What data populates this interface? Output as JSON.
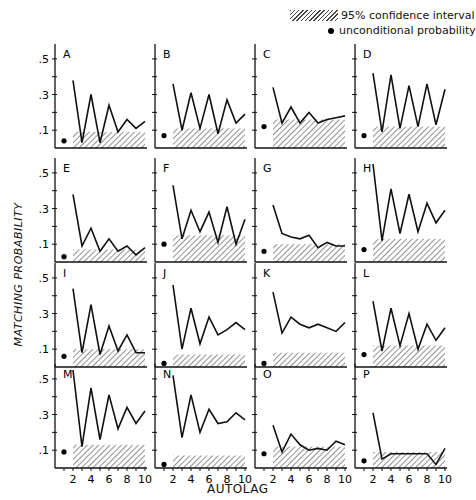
{
  "legend": {
    "ci_label": "95% confidence interval",
    "uncond_label": "unconditional probability"
  },
  "axes": {
    "ylabel": "MATCHING PROBABILITY",
    "xlabel": "AUTOLAG",
    "yticks": [
      ".1",
      ".3",
      ".5"
    ],
    "xticks": [
      "2",
      "4",
      "6",
      "8",
      "10"
    ]
  },
  "chart_data": {
    "type": "line",
    "title": "",
    "xlabel": "AUTOLAG",
    "ylabel": "MATCHING PROBABILITY",
    "xlim": [
      0,
      10
    ],
    "ylim": [
      0,
      0.55
    ],
    "grid": false,
    "legend_position": "top-right",
    "legend": [
      "95% confidence interval",
      "unconditional probability"
    ],
    "x": [
      2,
      3,
      4,
      5,
      6,
      7,
      8,
      9,
      10
    ],
    "panels": [
      {
        "label": "A",
        "uncond": 0.04,
        "values": [
          0.38,
          0.03,
          0.3,
          0.03,
          0.24,
          0.09,
          0.16,
          0.11,
          0.15
        ],
        "ci_upper": 0.09
      },
      {
        "label": "B",
        "uncond": 0.07,
        "values": [
          0.36,
          0.1,
          0.31,
          0.11,
          0.3,
          0.08,
          0.27,
          0.14,
          0.19
        ],
        "ci_upper": 0.11
      },
      {
        "label": "C",
        "uncond": 0.12,
        "values": [
          0.34,
          0.14,
          0.23,
          0.14,
          0.2,
          0.14,
          0.16,
          0.17,
          0.18
        ],
        "ci_upper": 0.16
      },
      {
        "label": "D",
        "uncond": 0.07,
        "values": [
          0.42,
          0.09,
          0.41,
          0.11,
          0.35,
          0.12,
          0.36,
          0.13,
          0.33
        ],
        "ci_upper": 0.12
      },
      {
        "label": "E",
        "uncond": 0.03,
        "values": [
          0.38,
          0.09,
          0.19,
          0.06,
          0.13,
          0.06,
          0.09,
          0.04,
          0.08
        ],
        "ci_upper": 0.07
      },
      {
        "label": "F",
        "uncond": 0.1,
        "values": [
          0.43,
          0.13,
          0.29,
          0.17,
          0.28,
          0.11,
          0.31,
          0.1,
          0.24
        ],
        "ci_upper": 0.15
      },
      {
        "label": "G",
        "uncond": 0.06,
        "values": [
          0.32,
          0.16,
          0.14,
          0.13,
          0.15,
          0.08,
          0.11,
          0.09,
          0.09
        ],
        "ci_upper": 0.1
      },
      {
        "label": "H",
        "uncond": 0.07,
        "values": [
          0.55,
          0.12,
          0.41,
          0.16,
          0.38,
          0.17,
          0.33,
          0.22,
          0.29
        ],
        "ci_upper": 0.13
      },
      {
        "label": "I",
        "uncond": 0.06,
        "values": [
          0.44,
          0.08,
          0.35,
          0.07,
          0.23,
          0.09,
          0.18,
          0.08,
          0.08
        ],
        "ci_upper": 0.1
      },
      {
        "label": "J",
        "uncond": 0.02,
        "values": [
          0.46,
          0.1,
          0.33,
          0.13,
          0.28,
          0.18,
          0.21,
          0.25,
          0.21
        ],
        "ci_upper": 0.07
      },
      {
        "label": "K",
        "uncond": 0.02,
        "values": [
          0.42,
          0.19,
          0.28,
          0.24,
          0.22,
          0.24,
          0.22,
          0.2,
          0.25
        ],
        "ci_upper": 0.08
      },
      {
        "label": "L",
        "uncond": 0.07,
        "values": [
          0.37,
          0.09,
          0.33,
          0.12,
          0.3,
          0.1,
          0.24,
          0.15,
          0.22
        ],
        "ci_upper": 0.12
      },
      {
        "label": "M",
        "uncond": 0.09,
        "values": [
          0.55,
          0.12,
          0.45,
          0.16,
          0.41,
          0.22,
          0.34,
          0.25,
          0.32
        ],
        "ci_upper": 0.13
      },
      {
        "label": "N",
        "uncond": 0.02,
        "values": [
          0.52,
          0.17,
          0.41,
          0.2,
          0.33,
          0.25,
          0.26,
          0.31,
          0.27
        ],
        "ci_upper": 0.07
      },
      {
        "label": "O",
        "uncond": 0.08,
        "values": [
          0.24,
          0.09,
          0.19,
          0.13,
          0.1,
          0.11,
          0.1,
          0.15,
          0.13
        ],
        "ci_upper": 0.12
      },
      {
        "label": "P",
        "uncond": 0.04,
        "values": [
          0.31,
          0.05,
          0.08,
          0.08,
          0.08,
          0.08,
          0.08,
          0.02,
          0.11
        ],
        "ci_upper": 0.09
      }
    ]
  }
}
